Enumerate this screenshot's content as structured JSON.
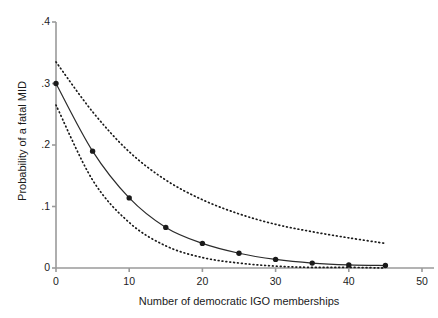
{
  "chart_data": {
    "type": "line",
    "title": "",
    "xlabel": "Number of democratic IGO memberships",
    "ylabel": "Probability of a fatal MID",
    "xlim": [
      0,
      50
    ],
    "ylim": [
      0,
      0.4
    ],
    "xticks": [
      0,
      10,
      20,
      30,
      40,
      50
    ],
    "xtick_labels": [
      "0",
      "10",
      "20",
      "30",
      "40",
      "50"
    ],
    "yticks": [
      0,
      0.1,
      0.2,
      0.3,
      0.4
    ],
    "ytick_labels": [
      "0",
      ".1",
      ".2",
      ".3",
      ".4"
    ],
    "grid": false,
    "legend": null,
    "series": [
      {
        "name": "Predicted probability",
        "style": "solid-with-markers",
        "marker": "filled-circle",
        "color": "#1a1a1a",
        "x": [
          0,
          5,
          10,
          15,
          20,
          25,
          30,
          35,
          40,
          45
        ],
        "values": [
          0.3,
          0.19,
          0.114,
          0.066,
          0.04,
          0.024,
          0.014,
          0.008,
          0.005,
          0.004
        ]
      },
      {
        "name": "Upper confidence bound",
        "style": "dotted",
        "marker": "none",
        "color": "#1a1a1a",
        "x": [
          0,
          5,
          10,
          15,
          20,
          25,
          30,
          35,
          40,
          45
        ],
        "values": [
          0.335,
          0.254,
          0.189,
          0.143,
          0.111,
          0.088,
          0.071,
          0.059,
          0.049,
          0.04
        ]
      },
      {
        "name": "Lower confidence bound",
        "style": "dotted",
        "marker": "none",
        "color": "#1a1a1a",
        "x": [
          0,
          5,
          10,
          15,
          20,
          25,
          30,
          35,
          40,
          45
        ],
        "values": [
          0.265,
          0.143,
          0.074,
          0.036,
          0.017,
          0.008,
          0.003,
          0.001,
          0.001,
          0.0
        ]
      }
    ]
  },
  "axes": {
    "x_label": "Number of democratic IGO memberships",
    "y_label": "Probability of a fatal MID"
  }
}
